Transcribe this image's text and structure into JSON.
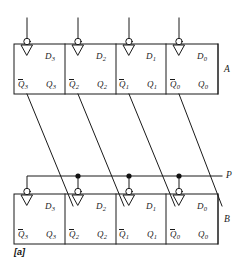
{
  "figure": {
    "caption": "[a]"
  },
  "registers": [
    {
      "name": "A",
      "group_label": "A",
      "row": "top",
      "cells": [
        {
          "d_label": "D",
          "d_sub": "3",
          "qbar_label": "Q",
          "qbar_sub": "3",
          "q_label": "Q",
          "q_sub": "3"
        },
        {
          "d_label": "D",
          "d_sub": "2",
          "qbar_label": "Q",
          "qbar_sub": "2",
          "q_label": "Q",
          "q_sub": "2"
        },
        {
          "d_label": "D",
          "d_sub": "1",
          "qbar_label": "Q",
          "qbar_sub": "1",
          "q_label": "Q",
          "q_sub": "1"
        },
        {
          "d_label": "D",
          "d_sub": "0",
          "qbar_label": "Q",
          "qbar_sub": "0",
          "q_label": "Q",
          "q_sub": "0"
        }
      ]
    },
    {
      "name": "B",
      "group_label": "B",
      "row": "bottom",
      "cells": [
        {
          "d_label": "D",
          "d_sub": "3",
          "qbar_label": "Q",
          "qbar_sub": "3",
          "q_label": "Q",
          "q_sub": "3"
        },
        {
          "d_label": "D",
          "d_sub": "2",
          "qbar_label": "Q",
          "qbar_sub": "2",
          "q_label": "Q",
          "q_sub": "2"
        },
        {
          "d_label": "D",
          "d_sub": "1",
          "qbar_label": "Q",
          "qbar_sub": "1",
          "q_label": "Q",
          "q_sub": "1"
        },
        {
          "d_label": "D",
          "d_sub": "0",
          "qbar_label": "Q",
          "qbar_sub": "0",
          "q_label": "Q",
          "q_sub": "0"
        }
      ]
    }
  ],
  "signals": [
    {
      "name": "P",
      "label": "P",
      "kind": "clock-bus",
      "junction_dots": 3
    }
  ],
  "colors": {
    "stroke": "#1a1a1a",
    "text": "#1a1a1a",
    "background": "#ffffff",
    "junction_fill": "#111111",
    "bubble_fill": "#ffffff"
  },
  "geometry": {
    "top_box": {
      "x": 14,
      "y": 44,
      "width": 204,
      "height": 50
    },
    "bottom_box": {
      "x": 14,
      "y": 194,
      "width": 204,
      "height": 50
    },
    "dividers_x": [
      65,
      116,
      166
    ],
    "clock_x": [
      27,
      78,
      129,
      179
    ],
    "p_line_y": 176,
    "p_line_x_end": 222
  }
}
